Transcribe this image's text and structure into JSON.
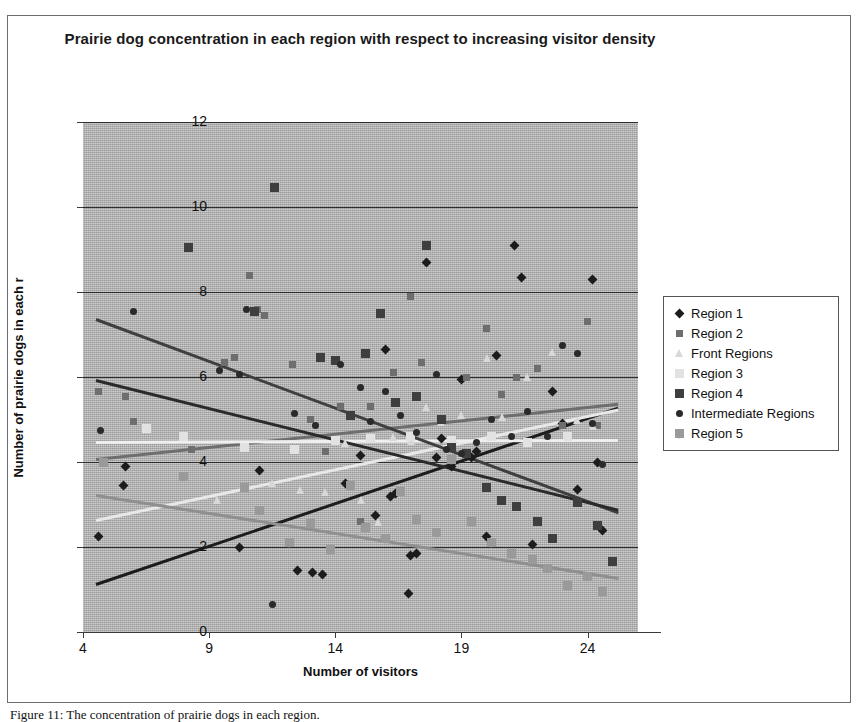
{
  "chart_data": {
    "type": "scatter",
    "title": "Prairie dog concentration in each region with respect to increasing visitor density",
    "xlabel": "Number of visitors",
    "ylabel": "Number of prairie dogs in each r",
    "xlim": [
      4,
      26
    ],
    "ylim": [
      0,
      12
    ],
    "xticks": [
      4,
      9,
      14,
      19,
      24
    ],
    "yticks": [
      0,
      2,
      4,
      6,
      8,
      10,
      12
    ],
    "grid": true,
    "legend_position": "right",
    "plot_background": "#b3b3b3",
    "series": [
      {
        "name": "Region 1",
        "marker": "diamond",
        "color": "#1c1c1c",
        "trendline": {
          "x0": 4.5,
          "y0": 1.15,
          "x1": 25.2,
          "y1": 5.3,
          "color": "#1c1c1c"
        },
        "points": [
          [
            4.6,
            2.25
          ],
          [
            5.6,
            3.45
          ],
          [
            5.7,
            3.9
          ],
          [
            10.2,
            2.0
          ],
          [
            11.0,
            3.8
          ],
          [
            12.5,
            1.45
          ],
          [
            13.1,
            1.4
          ],
          [
            13.5,
            1.35
          ],
          [
            14.4,
            3.5
          ],
          [
            15.0,
            4.15
          ],
          [
            15.6,
            2.75
          ],
          [
            16.0,
            6.65
          ],
          [
            16.2,
            3.2
          ],
          [
            16.4,
            3.25
          ],
          [
            16.9,
            0.9
          ],
          [
            17.0,
            1.8
          ],
          [
            17.2,
            1.85
          ],
          [
            17.6,
            8.7
          ],
          [
            18.0,
            4.1
          ],
          [
            18.2,
            4.55
          ],
          [
            18.6,
            3.9
          ],
          [
            19.0,
            5.95
          ],
          [
            19.4,
            4.1
          ],
          [
            19.6,
            4.25
          ],
          [
            20.0,
            2.25
          ],
          [
            20.4,
            6.5
          ],
          [
            21.1,
            9.1
          ],
          [
            21.4,
            8.35
          ],
          [
            21.8,
            2.05
          ],
          [
            22.6,
            5.65
          ],
          [
            23.0,
            4.9
          ],
          [
            23.6,
            3.35
          ],
          [
            24.2,
            8.3
          ],
          [
            24.4,
            4.0
          ],
          [
            24.6,
            2.4
          ]
        ]
      },
      {
        "name": "Region 2",
        "marker": "square",
        "color": "#6e6e6e",
        "trendline": {
          "x0": 4.5,
          "y0": 4.1,
          "x1": 25.2,
          "y1": 5.4,
          "color": "#6e6e6e"
        },
        "points": [
          [
            4.6,
            5.65
          ],
          [
            5.7,
            5.55
          ],
          [
            6.0,
            4.95
          ],
          [
            8.3,
            4.3
          ],
          [
            9.6,
            6.35
          ],
          [
            10.0,
            6.45
          ],
          [
            10.6,
            8.4
          ],
          [
            10.9,
            7.6
          ],
          [
            11.2,
            7.45
          ],
          [
            12.3,
            6.3
          ],
          [
            13.0,
            5.0
          ],
          [
            13.6,
            4.25
          ],
          [
            14.2,
            5.3
          ],
          [
            15.0,
            2.6
          ],
          [
            15.4,
            5.3
          ],
          [
            16.3,
            6.1
          ],
          [
            17.0,
            7.9
          ],
          [
            17.4,
            6.35
          ],
          [
            18.6,
            4.45
          ],
          [
            19.2,
            6.0
          ],
          [
            20.0,
            7.15
          ],
          [
            20.6,
            5.6
          ],
          [
            21.2,
            6.0
          ],
          [
            22.0,
            6.2
          ],
          [
            23.0,
            4.85
          ],
          [
            24.0,
            7.3
          ],
          [
            24.4,
            4.85
          ]
        ]
      },
      {
        "name": "Front Regions",
        "marker": "triangle",
        "color": "#d8d8d8",
        "trendline": {
          "x0": 4.5,
          "y0": 2.65,
          "x1": 25.2,
          "y1": 5.25,
          "color": "#e8e8e8"
        },
        "points": [
          [
            9.3,
            3.1
          ],
          [
            11.5,
            3.5
          ],
          [
            12.6,
            3.35
          ],
          [
            13.6,
            3.3
          ],
          [
            14.4,
            4.45
          ],
          [
            15.0,
            3.1
          ],
          [
            15.7,
            2.6
          ],
          [
            16.3,
            4.6
          ],
          [
            17.0,
            4.5
          ],
          [
            17.6,
            5.3
          ],
          [
            18.2,
            4.95
          ],
          [
            19.0,
            5.1
          ],
          [
            20.0,
            6.45
          ],
          [
            20.6,
            5.05
          ],
          [
            21.6,
            6.0
          ],
          [
            22.6,
            6.6
          ],
          [
            23.6,
            5.0
          ],
          [
            24.2,
            4.85
          ]
        ]
      },
      {
        "name": "Region 3",
        "marker": "x",
        "color": "#e2e2e2",
        "trendline": {
          "x0": 4.5,
          "y0": 4.5,
          "x1": 25.2,
          "y1": 4.55,
          "color": "#efefef"
        },
        "points": [
          [
            6.5,
            4.8
          ],
          [
            8.0,
            4.6
          ],
          [
            10.4,
            4.35
          ],
          [
            12.4,
            4.3
          ],
          [
            14.0,
            4.5
          ],
          [
            15.4,
            4.55
          ],
          [
            17.0,
            4.6
          ],
          [
            18.6,
            4.5
          ],
          [
            20.2,
            4.6
          ],
          [
            21.6,
            4.45
          ],
          [
            23.2,
            4.6
          ]
        ]
      },
      {
        "name": "Region 4",
        "marker": "x",
        "color": "#3f3f3f",
        "trendline": {
          "x0": 4.5,
          "y0": 7.4,
          "x1": 25.2,
          "y1": 2.85,
          "color": "#3f3f3f"
        },
        "points": [
          [
            8.2,
            9.05
          ],
          [
            11.6,
            10.45
          ],
          [
            10.8,
            7.55
          ],
          [
            13.4,
            6.45
          ],
          [
            14.0,
            6.4
          ],
          [
            14.6,
            5.1
          ],
          [
            15.2,
            6.55
          ],
          [
            15.8,
            7.5
          ],
          [
            16.4,
            5.4
          ],
          [
            17.2,
            5.55
          ],
          [
            17.6,
            9.1
          ],
          [
            18.2,
            5.0
          ],
          [
            18.6,
            4.35
          ],
          [
            19.2,
            4.2
          ],
          [
            20.0,
            3.4
          ],
          [
            20.6,
            3.1
          ],
          [
            21.2,
            2.95
          ],
          [
            22.0,
            2.6
          ],
          [
            22.6,
            2.2
          ],
          [
            23.6,
            3.05
          ],
          [
            24.4,
            2.5
          ],
          [
            25.0,
            1.65
          ]
        ]
      },
      {
        "name": "Intermediate Regions",
        "marker": "circle",
        "color": "#2a2a2a",
        "trendline": {
          "x0": 4.5,
          "y0": 5.95,
          "x1": 25.2,
          "y1": 2.9,
          "color": "#2a2a2a"
        },
        "points": [
          [
            4.7,
            4.75
          ],
          [
            6.0,
            7.55
          ],
          [
            9.4,
            6.15
          ],
          [
            10.2,
            6.05
          ],
          [
            10.5,
            7.6
          ],
          [
            11.5,
            0.65
          ],
          [
            12.4,
            5.15
          ],
          [
            13.2,
            4.85
          ],
          [
            14.2,
            6.3
          ],
          [
            15.0,
            5.75
          ],
          [
            15.4,
            4.95
          ],
          [
            16.0,
            5.65
          ],
          [
            16.6,
            5.1
          ],
          [
            17.2,
            4.7
          ],
          [
            18.0,
            6.05
          ],
          [
            18.4,
            4.3
          ],
          [
            19.0,
            4.2
          ],
          [
            19.6,
            4.45
          ],
          [
            20.2,
            5.0
          ],
          [
            21.0,
            4.6
          ],
          [
            21.6,
            5.2
          ],
          [
            22.4,
            4.6
          ],
          [
            23.0,
            6.75
          ],
          [
            23.6,
            6.55
          ],
          [
            24.2,
            4.9
          ],
          [
            24.6,
            3.95
          ]
        ]
      },
      {
        "name": "Region 5",
        "marker": "plus",
        "color": "#9a9a9a",
        "trendline": {
          "x0": 4.5,
          "y0": 3.25,
          "x1": 25.2,
          "y1": 1.3,
          "color": "#8f8f8f"
        },
        "points": [
          [
            4.8,
            4.0
          ],
          [
            8.0,
            3.65
          ],
          [
            10.4,
            3.4
          ],
          [
            11.0,
            2.85
          ],
          [
            12.2,
            2.1
          ],
          [
            13.0,
            2.55
          ],
          [
            13.8,
            1.95
          ],
          [
            14.6,
            3.45
          ],
          [
            15.2,
            2.45
          ],
          [
            16.0,
            2.2
          ],
          [
            16.6,
            3.3
          ],
          [
            17.2,
            2.65
          ],
          [
            18.0,
            2.35
          ],
          [
            18.6,
            4.05
          ],
          [
            19.4,
            2.6
          ],
          [
            20.2,
            2.1
          ],
          [
            21.0,
            1.85
          ],
          [
            21.8,
            1.7
          ],
          [
            22.4,
            1.5
          ],
          [
            23.2,
            1.1
          ],
          [
            24.0,
            1.3
          ],
          [
            24.6,
            0.95
          ]
        ]
      }
    ]
  },
  "caption": "Figure 11: The concentration of prairie dogs in each region."
}
